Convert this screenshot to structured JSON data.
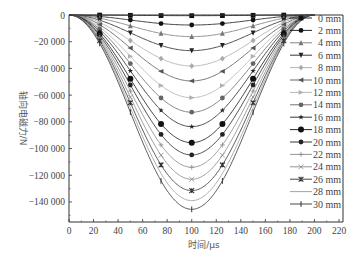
{
  "chart_data": {
    "type": "line",
    "title": "",
    "xlabel": "时间/μs",
    "ylabel": "轴向电磁力/N",
    "xlim": [
      0,
      220
    ],
    "ylim": [
      -155000,
      0
    ],
    "xticks": [
      0,
      20,
      40,
      60,
      80,
      100,
      120,
      140,
      160,
      180,
      200,
      220
    ],
    "yticks": [
      0,
      -20000,
      -40000,
      -60000,
      -80000,
      -100000,
      -120000,
      -140000
    ],
    "ytick_labels": [
      "0",
      "−20 000",
      "−40 000",
      "−60 000",
      "−80 000",
      "−100 000",
      "−120 000",
      "−140 000"
    ],
    "xtick_labels": [
      "0",
      "20",
      "40",
      "60",
      "80",
      "100",
      "120",
      "140",
      "160",
      "180",
      "200",
      "220"
    ],
    "grid": false,
    "legend_position": "right",
    "pulse_start": 0,
    "pulse_end": 200,
    "marker_times": [
      25,
      50,
      75,
      100,
      125,
      150,
      175
    ],
    "series": [
      {
        "name": "0 mm",
        "peak": -500,
        "marker": "square",
        "color": "#111111"
      },
      {
        "name": "2 mm",
        "peak": -7500,
        "marker": "circle",
        "color": "#111111"
      },
      {
        "name": "4 mm",
        "peak": -16200,
        "marker": "triangle-up",
        "color": "#777777"
      },
      {
        "name": "6 mm",
        "peak": -26700,
        "marker": "triangle-down",
        "color": "#222222"
      },
      {
        "name": "8 mm",
        "peak": -38200,
        "marker": "diamond",
        "color": "#aaaaaa"
      },
      {
        "name": "10 mm",
        "peak": -49400,
        "marker": "triangle-left",
        "color": "#555555"
      },
      {
        "name": "12 mm",
        "peak": -61900,
        "marker": "triangle-right",
        "color": "#b0b0b0"
      },
      {
        "name": "14 mm",
        "peak": -72800,
        "marker": "hexagon",
        "color": "#666666"
      },
      {
        "name": "16 mm",
        "peak": -83600,
        "marker": "star",
        "color": "#222222"
      },
      {
        "name": "18 mm",
        "peak": -95600,
        "marker": "big-circle",
        "color": "#111111"
      },
      {
        "name": "20 mm",
        "peak": -104800,
        "marker": "circle",
        "color": "#222222"
      },
      {
        "name": "22 mm",
        "peak": -114000,
        "marker": "plus",
        "color": "#888888"
      },
      {
        "name": "24 mm",
        "peak": -123000,
        "marker": "x",
        "color": "#888888"
      },
      {
        "name": "26 mm",
        "peak": -131500,
        "marker": "asterisk",
        "color": "#333333"
      },
      {
        "name": "28 mm",
        "peak": -139000,
        "marker": "none",
        "color": "#999999"
      },
      {
        "name": "30 mm",
        "peak": -145500,
        "marker": "vbar",
        "color": "#333333"
      }
    ]
  }
}
